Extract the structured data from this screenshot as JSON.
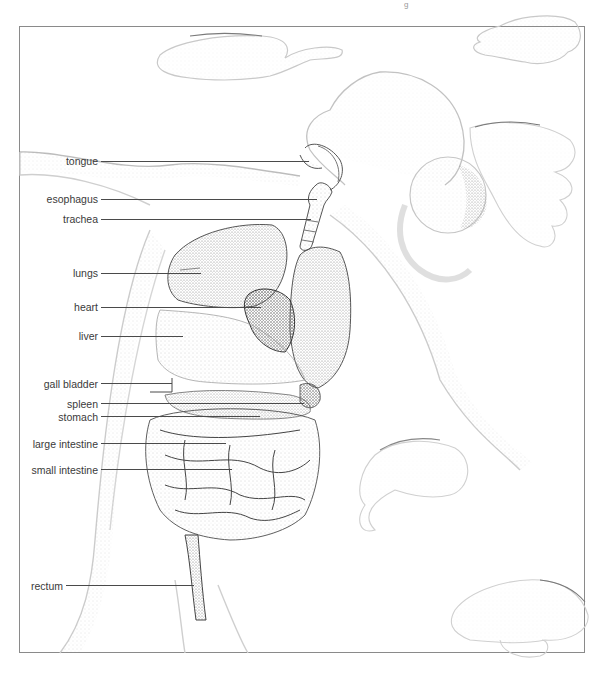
{
  "figure": {
    "style": "stippled pen-and-ink drawing",
    "colors": {
      "frame": "#8a8a8a",
      "label_text": "#3a3a3a",
      "leader_line": "#4a4a4a",
      "stipple": "#9a9a9a",
      "organ_ink": "#555555"
    }
  },
  "labels": [
    {
      "id": "tongue",
      "text": "tongue",
      "x": 0,
      "y": 155,
      "line_x1": 100,
      "line_x2": 310
    },
    {
      "id": "esophagus",
      "text": "esophagus",
      "x": 0,
      "y": 193,
      "line_x1": 100,
      "line_x2": 318
    },
    {
      "id": "trachea",
      "text": "trachea",
      "x": 0,
      "y": 213,
      "line_x1": 100,
      "line_x2": 312
    },
    {
      "id": "lungs",
      "text": "lungs",
      "x": 0,
      "y": 267,
      "line_x1": 100,
      "line_x2": 200
    },
    {
      "id": "heart",
      "text": "heart",
      "x": 0,
      "y": 301,
      "line_x1": 100,
      "line_x2": 260
    },
    {
      "id": "liver",
      "text": "liver",
      "x": 0,
      "y": 330,
      "line_x1": 100,
      "line_x2": 182
    },
    {
      "id": "gall-bladder",
      "text": "gall bladder",
      "x": 0,
      "y": 378,
      "line_x1": 100,
      "line_x2": 172
    },
    {
      "id": "spleen",
      "text": "spleen",
      "x": 0,
      "y": 398,
      "line_x1": 100,
      "line_x2": 304
    },
    {
      "id": "stomach",
      "text": "stomach",
      "x": 0,
      "y": 411,
      "line_x1": 100,
      "line_x2": 260
    },
    {
      "id": "large-intestine",
      "text": "large intestine",
      "x": 0,
      "y": 438,
      "line_x1": 100,
      "line_x2": 226
    },
    {
      "id": "small-intestine",
      "text": "small intestine",
      "x": 0,
      "y": 464,
      "line_x1": 100,
      "line_x2": 232
    },
    {
      "id": "rectum",
      "text": "rectum",
      "x": 0,
      "y": 580,
      "line_x1": 66,
      "line_x2": 194
    }
  ],
  "header": {
    "page_mark": "g"
  }
}
